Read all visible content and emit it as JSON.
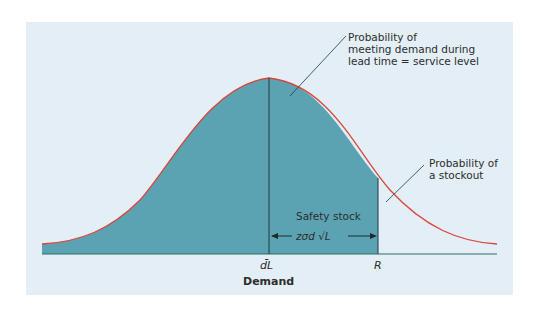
{
  "diagram": {
    "type": "normal-distribution-reorder-point",
    "colors": {
      "panel_bg": "#e3eef6",
      "fill": "#5ba3b2",
      "curve": "#d9473c",
      "axis": "#2e6f62",
      "lines": "#1e3a40"
    },
    "annotations": {
      "service_level": [
        "Probability of",
        "meeting demand during",
        "lead time = service level"
      ],
      "stockout": [
        "Probability of",
        "a stockout"
      ],
      "safety_stock_label": "Safety stock",
      "safety_stock_formula": "zσd √L"
    },
    "x_axis": {
      "ticks": [
        "d̄L",
        "R"
      ],
      "label": "Demand"
    }
  }
}
